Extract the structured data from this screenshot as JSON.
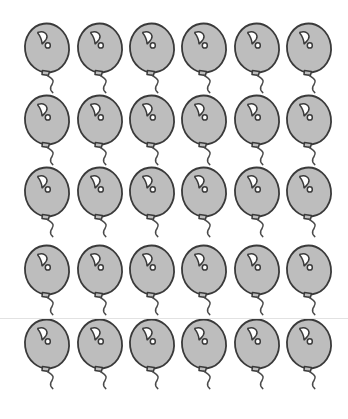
{
  "page": {
    "title": "Balloon counting sheet",
    "background_color": "#ffffff",
    "width": 348,
    "height": 419
  },
  "divider": {
    "name": "horizontal-rule",
    "color": "#e2e2e2",
    "y": 318
  },
  "balloon": {
    "icon_name": "balloon-icon",
    "body_fill": "#bdbdbd",
    "outline_color": "#3a3a3a",
    "highlight_fill": "#ffffff",
    "string_color": "#4a4a4a",
    "outline_width": 1.8,
    "label": "balloon"
  },
  "grid": {
    "rows": 5,
    "columns": 6,
    "total_count": 30,
    "column_x": [
      22,
      75,
      127,
      179,
      232,
      284
    ],
    "row_y": [
      22,
      94,
      166,
      244,
      318
    ],
    "cells": [
      {
        "row": 1,
        "col": 1,
        "index": 1,
        "x": 22,
        "y": 22
      },
      {
        "row": 1,
        "col": 2,
        "index": 2,
        "x": 75,
        "y": 22
      },
      {
        "row": 1,
        "col": 3,
        "index": 3,
        "x": 127,
        "y": 22
      },
      {
        "row": 1,
        "col": 4,
        "index": 4,
        "x": 179,
        "y": 22
      },
      {
        "row": 1,
        "col": 5,
        "index": 5,
        "x": 232,
        "y": 22
      },
      {
        "row": 1,
        "col": 6,
        "index": 6,
        "x": 284,
        "y": 22
      },
      {
        "row": 2,
        "col": 1,
        "index": 7,
        "x": 22,
        "y": 94
      },
      {
        "row": 2,
        "col": 2,
        "index": 8,
        "x": 75,
        "y": 94
      },
      {
        "row": 2,
        "col": 3,
        "index": 9,
        "x": 127,
        "y": 94
      },
      {
        "row": 2,
        "col": 4,
        "index": 10,
        "x": 179,
        "y": 94
      },
      {
        "row": 2,
        "col": 5,
        "index": 11,
        "x": 232,
        "y": 94
      },
      {
        "row": 2,
        "col": 6,
        "index": 12,
        "x": 284,
        "y": 94
      },
      {
        "row": 3,
        "col": 1,
        "index": 13,
        "x": 22,
        "y": 166
      },
      {
        "row": 3,
        "col": 2,
        "index": 14,
        "x": 75,
        "y": 166
      },
      {
        "row": 3,
        "col": 3,
        "index": 15,
        "x": 127,
        "y": 166
      },
      {
        "row": 3,
        "col": 4,
        "index": 16,
        "x": 179,
        "y": 166
      },
      {
        "row": 3,
        "col": 5,
        "index": 17,
        "x": 232,
        "y": 166
      },
      {
        "row": 3,
        "col": 6,
        "index": 18,
        "x": 284,
        "y": 166
      },
      {
        "row": 4,
        "col": 1,
        "index": 19,
        "x": 22,
        "y": 244
      },
      {
        "row": 4,
        "col": 2,
        "index": 20,
        "x": 75,
        "y": 244
      },
      {
        "row": 4,
        "col": 3,
        "index": 21,
        "x": 127,
        "y": 244
      },
      {
        "row": 4,
        "col": 4,
        "index": 22,
        "x": 179,
        "y": 244
      },
      {
        "row": 4,
        "col": 5,
        "index": 23,
        "x": 232,
        "y": 244
      },
      {
        "row": 4,
        "col": 6,
        "index": 24,
        "x": 284,
        "y": 244
      },
      {
        "row": 5,
        "col": 1,
        "index": 25,
        "x": 22,
        "y": 318
      },
      {
        "row": 5,
        "col": 2,
        "index": 26,
        "x": 75,
        "y": 318
      },
      {
        "row": 5,
        "col": 3,
        "index": 27,
        "x": 127,
        "y": 318
      },
      {
        "row": 5,
        "col": 4,
        "index": 28,
        "x": 179,
        "y": 318
      },
      {
        "row": 5,
        "col": 5,
        "index": 29,
        "x": 232,
        "y": 318
      },
      {
        "row": 5,
        "col": 6,
        "index": 30,
        "x": 284,
        "y": 318
      }
    ]
  }
}
